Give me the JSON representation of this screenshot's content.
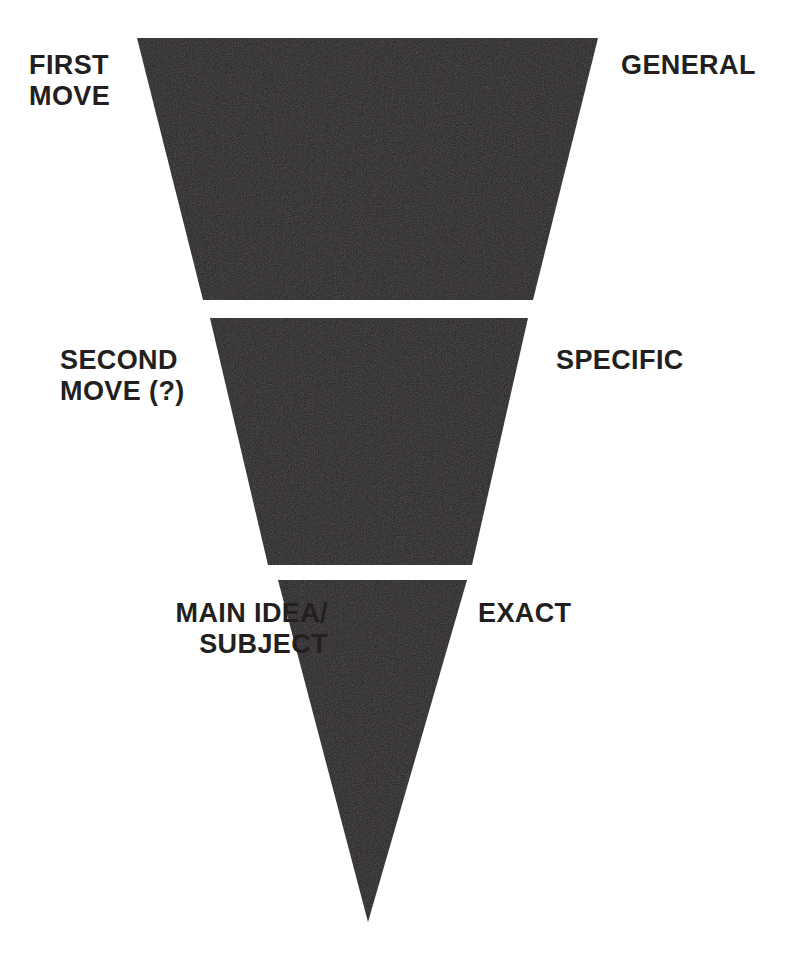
{
  "diagram": {
    "type": "inverted-pyramid",
    "background_color": "#ffffff",
    "shape_color": "#231f20",
    "text_color": "#231f20",
    "stages": [
      {
        "id": "stage-1",
        "stage_label": "FIRST\nMOVE",
        "specificity_label": "GENERAL",
        "shape": "trapezoid",
        "points": "137,38 598,38 533,300 203,300"
      },
      {
        "id": "stage-2",
        "stage_label": "SECOND\nMOVE (?)",
        "specificity_label": "SPECIFIC",
        "shape": "trapezoid",
        "points": "210,318 528,318 472,565 268,565"
      },
      {
        "id": "stage-3",
        "stage_label": "MAIN IDEA/\nSUBJECT",
        "specificity_label": "EXACT",
        "shape": "triangle",
        "points": "278,580 467,580 368,922"
      }
    ]
  },
  "chart_data": {
    "type": "pie",
    "categories": [
      "FIRST MOVE",
      "SECOND MOVE (?)",
      "MAIN IDEA/SUBJECT"
    ],
    "values": [
      47,
      33,
      20
    ],
    "annotations": [
      "GENERAL",
      "SPECIFIC",
      "EXACT"
    ],
    "xlabel": "",
    "ylabel": "",
    "legend": "none",
    "grid": false
  }
}
